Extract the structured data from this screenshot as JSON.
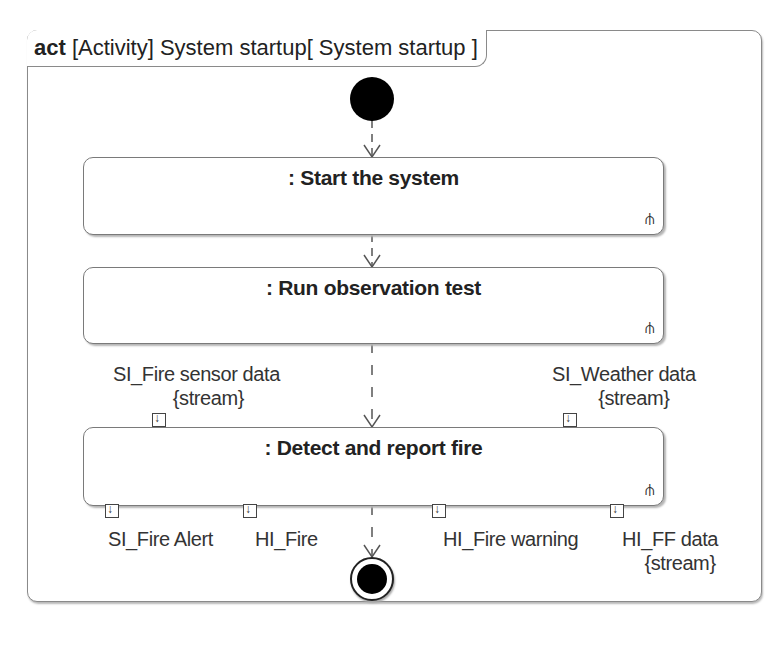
{
  "frame": {
    "keyword": "act",
    "title": "[Activity] System startup[ System startup ]"
  },
  "initial_node": {
    "type": "initial"
  },
  "final_node": {
    "type": "activity-final"
  },
  "actions": [
    {
      "label": ": Start the system",
      "icon": "rake-icon"
    },
    {
      "label": ": Run observation test",
      "icon": "rake-icon"
    },
    {
      "label": ": Detect and report fire",
      "icon": "rake-icon"
    }
  ],
  "input_pins": [
    {
      "name": "SI_Fire sensor data",
      "stereotype": "{stream}"
    },
    {
      "name": "SI_Weather data",
      "stereotype": "{stream}"
    }
  ],
  "output_pins": [
    {
      "name": "SI_Fire Alert",
      "stereotype": ""
    },
    {
      "name": "HI_Fire",
      "stereotype": ""
    },
    {
      "name": "HI_Fire warning",
      "stereotype": ""
    },
    {
      "name": "HI_FF data",
      "stereotype": "{stream}"
    }
  ],
  "icons": {
    "rake": "⫛"
  }
}
